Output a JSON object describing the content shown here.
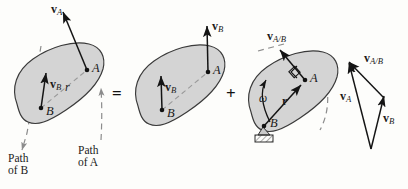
{
  "figure": {
    "equation": "v_A = v_B + v_A/B",
    "colors": {
      "background": "#fdfdfb",
      "body_fill": "#d4d4d4",
      "body_stroke": "#3a3a3a",
      "vector_stroke": "#141414",
      "dashed_path": "#8c8c8c",
      "support_fill": "#b9b9b9"
    }
  },
  "operators": {
    "equals": "=",
    "plus": "+"
  },
  "panel1": {
    "name": "general-plane-motion",
    "point_a": "A",
    "point_b": "B",
    "vector_a": {
      "bold": "v",
      "sub": "A"
    },
    "vector_b": {
      "bold": "v",
      "sub": "B"
    },
    "r_label": "r",
    "path_of_a": {
      "line1": "Path",
      "line2": "of A"
    },
    "path_of_b": {
      "line1": "Path",
      "line2": "of B"
    }
  },
  "panel2": {
    "name": "translation",
    "point_a": "A",
    "point_b": "B",
    "vector_b_at_a": {
      "bold": "v",
      "sub": "B"
    },
    "vector_b_at_b": {
      "bold": "v",
      "sub": "B"
    }
  },
  "panel3": {
    "name": "rotation-about-b",
    "point_a": "A",
    "point_b": "B",
    "omega": "ω",
    "r_label": "r",
    "vector_ab": {
      "bold": "v",
      "sub": "A/B"
    },
    "right_angle_mark": "90-degree"
  },
  "panel4": {
    "name": "vector-triangle",
    "vector_a": {
      "bold": "v",
      "sub": "A"
    },
    "vector_b": {
      "bold": "v",
      "sub": "B"
    },
    "vector_ab": {
      "bold": "v",
      "sub": "A/B"
    }
  }
}
